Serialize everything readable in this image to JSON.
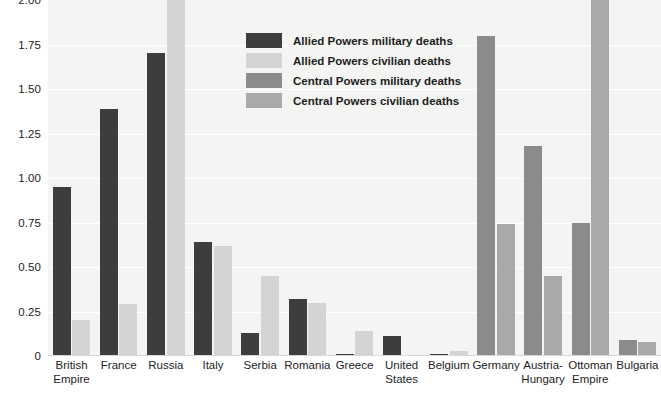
{
  "chart_data": {
    "type": "bar",
    "title": "",
    "subtitle": "",
    "xlabel": "",
    "ylabel": "",
    "ylim": [
      0,
      2.0
    ],
    "ytick_labels": [
      "2.00",
      "1.75",
      "1.50",
      "1.25",
      "1.00",
      "0.75",
      "0.50",
      "0.25",
      "0"
    ],
    "ytick_values": [
      2.0,
      1.75,
      1.5,
      1.25,
      1.0,
      0.75,
      0.5,
      0.25,
      0
    ],
    "grid": true,
    "legend_position": "inside-top-center",
    "note": "Values are in millions of deaths; Russia civilian and Ottoman Empire civilian bars are clipped at the top of the plot.",
    "categories": [
      "British\nEmpire",
      "France",
      "Russia",
      "Italy",
      "Serbia",
      "Romania",
      "Greece",
      "United\nStates",
      "Belgium",
      "Germany",
      "Austria-\nHungary",
      "Ottoman\nEmpire",
      "Bulgaria"
    ],
    "series": [
      {
        "name": "Allied Powers military deaths",
        "color": "#3d3d3d",
        "values": [
          0.95,
          1.39,
          1.7,
          0.64,
          0.13,
          0.32,
          0.01,
          0.11,
          0.01,
          null,
          null,
          null,
          null
        ]
      },
      {
        "name": "Allied Powers civilian deaths",
        "color": "#d4d4d2",
        "values": [
          0.2,
          0.29,
          2.05,
          0.62,
          0.45,
          0.3,
          0.14,
          0.0,
          0.03,
          null,
          null,
          null,
          null
        ]
      },
      {
        "name": "Central Powers military deaths",
        "color": "#8b8b8a",
        "values": [
          null,
          null,
          null,
          null,
          null,
          null,
          null,
          null,
          null,
          1.8,
          1.18,
          0.75,
          0.09
        ]
      },
      {
        "name": "Central Powers civilian deaths",
        "color": "#a9a9a7",
        "values": [
          null,
          null,
          null,
          null,
          null,
          null,
          null,
          null,
          null,
          0.74,
          0.45,
          2.05,
          0.08
        ]
      }
    ]
  },
  "legend": {
    "items": [
      {
        "label": "Allied Powers military deaths",
        "color": "#3d3d3d"
      },
      {
        "label": "Allied Powers civilian deaths",
        "color": "#d4d4d2"
      },
      {
        "label": "Central Powers military deaths",
        "color": "#8b8b8a"
      },
      {
        "label": "Central Powers civilian deaths",
        "color": "#a9a9a7"
      }
    ]
  }
}
